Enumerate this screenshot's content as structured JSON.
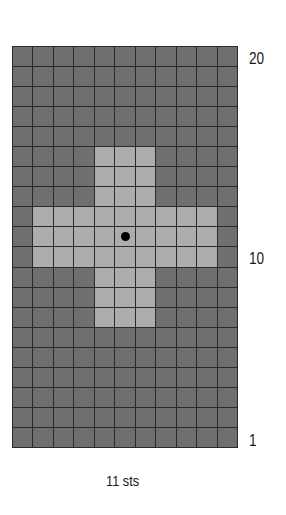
{
  "chart_data": {
    "type": "heatmap",
    "columns": 11,
    "rows": 20,
    "row_labels": [
      "20",
      "10",
      "1"
    ],
    "xlabel": "11 sts",
    "colors": {
      "background": "#6f6f6f",
      "contrast": "#adadad",
      "grid": "#2a2a2a",
      "marker": "#000000"
    },
    "pattern": "cross",
    "cells_light": {
      "vertical_bar": {
        "columns": [
          5,
          7
        ],
        "rows_from_top": [
          6,
          14
        ]
      },
      "horizontal_bar": {
        "columns": [
          2,
          10
        ],
        "rows_from_top": [
          9,
          11
        ]
      }
    },
    "center_marker": {
      "column": 6,
      "row_from_top": 10
    }
  },
  "labels": {
    "row_top": "20",
    "row_mid": "10",
    "row_bottom": "1",
    "stitch_count": "11 sts"
  }
}
